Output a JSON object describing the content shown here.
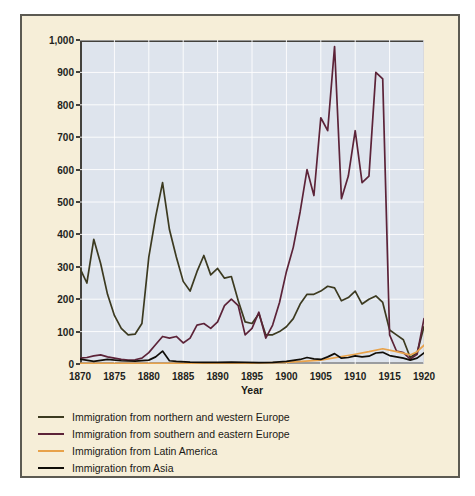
{
  "chart_data": {
    "type": "line",
    "title": "",
    "xlabel": "Year",
    "ylabel": "Immigrants (thousands)",
    "xlim": [
      1870,
      1920
    ],
    "ylim": [
      0,
      1000
    ],
    "xticks": [
      "1870",
      "1875",
      "1880",
      "1885",
      "1890",
      "1895",
      "1900",
      "1905",
      "1910",
      "1915",
      "1920"
    ],
    "yticks": [
      "0",
      "100",
      "200",
      "300",
      "400",
      "500",
      "600",
      "700",
      "800",
      "900",
      "1,000"
    ],
    "grid": true,
    "legend_position": "below",
    "plot_background": "#dee4ed",
    "figure_background": "#f6eed8",
    "series": [
      {
        "name": "Immigration from northern and western Europe",
        "color": "#3c3a20",
        "x": [
          1870,
          1871,
          1872,
          1873,
          1874,
          1875,
          1876,
          1877,
          1878,
          1879,
          1880,
          1881,
          1882,
          1883,
          1884,
          1885,
          1886,
          1887,
          1888,
          1889,
          1890,
          1891,
          1892,
          1893,
          1894,
          1895,
          1896,
          1897,
          1898,
          1899,
          1900,
          1901,
          1902,
          1903,
          1904,
          1905,
          1906,
          1907,
          1908,
          1909,
          1910,
          1911,
          1912,
          1913,
          1914,
          1915,
          1916,
          1917,
          1918,
          1919,
          1920
        ],
        "values": [
          295,
          250,
          385,
          310,
          215,
          150,
          110,
          90,
          92,
          125,
          330,
          455,
          560,
          415,
          330,
          255,
          225,
          285,
          335,
          275,
          295,
          265,
          270,
          195,
          130,
          125,
          155,
          90,
          90,
          100,
          115,
          140,
          185,
          215,
          215,
          225,
          240,
          235,
          195,
          205,
          225,
          185,
          200,
          210,
          190,
          105,
          90,
          75,
          20,
          35,
          115
        ]
      },
      {
        "name": "Immigration from southern and eastern Europe",
        "color": "#5c2338",
        "x": [
          1870,
          1871,
          1872,
          1873,
          1874,
          1875,
          1876,
          1877,
          1878,
          1879,
          1880,
          1881,
          1882,
          1883,
          1884,
          1885,
          1886,
          1887,
          1888,
          1889,
          1890,
          1891,
          1892,
          1893,
          1894,
          1895,
          1896,
          1897,
          1898,
          1899,
          1900,
          1901,
          1902,
          1903,
          1904,
          1905,
          1906,
          1907,
          1908,
          1909,
          1910,
          1911,
          1912,
          1913,
          1914,
          1915,
          1916,
          1917,
          1918,
          1919,
          1920
        ],
        "values": [
          18,
          20,
          25,
          28,
          22,
          18,
          14,
          12,
          13,
          18,
          35,
          60,
          85,
          80,
          85,
          65,
          80,
          120,
          125,
          110,
          130,
          180,
          200,
          180,
          90,
          110,
          160,
          80,
          120,
          190,
          285,
          360,
          470,
          600,
          520,
          760,
          720,
          980,
          510,
          580,
          720,
          560,
          580,
          900,
          880,
          90,
          40,
          35,
          15,
          30,
          140
        ]
      },
      {
        "name": "Immigration from Latin America",
        "color": "#e8a24a",
        "x": [
          1870,
          1875,
          1880,
          1885,
          1890,
          1895,
          1900,
          1905,
          1910,
          1912,
          1914,
          1916,
          1918,
          1919,
          1920
        ],
        "values": [
          2,
          2,
          2,
          2,
          3,
          3,
          5,
          12,
          30,
          38,
          47,
          38,
          28,
          38,
          58
        ]
      },
      {
        "name": "Immigration from Asia",
        "color": "#100d08",
        "x": [
          1870,
          1872,
          1874,
          1876,
          1878,
          1880,
          1881,
          1882,
          1883,
          1884,
          1886,
          1888,
          1890,
          1892,
          1894,
          1896,
          1898,
          1900,
          1902,
          1903,
          1904,
          1905,
          1906,
          1907,
          1908,
          1909,
          1910,
          1911,
          1912,
          1913,
          1914,
          1915,
          1916,
          1917,
          1918,
          1919,
          1920
        ],
        "values": [
          15,
          8,
          14,
          10,
          9,
          12,
          22,
          40,
          10,
          8,
          6,
          5,
          5,
          6,
          5,
          4,
          5,
          8,
          14,
          20,
          16,
          14,
          22,
          32,
          18,
          20,
          25,
          22,
          24,
          34,
          36,
          26,
          22,
          18,
          12,
          18,
          34
        ]
      }
    ]
  },
  "legend": {
    "items": [
      {
        "label": "Immigration from northern and western Europe",
        "color": "#3c3a20"
      },
      {
        "label": "Immigration from southern and eastern Europe",
        "color": "#5c2338"
      },
      {
        "label": "Immigration from Latin America",
        "color": "#e8a24a"
      },
      {
        "label": "Immigration from Asia",
        "color": "#100d08"
      }
    ]
  }
}
